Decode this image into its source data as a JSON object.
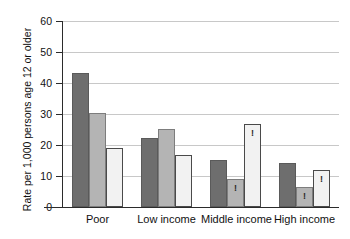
{
  "chart_data": {
    "type": "bar",
    "title": "",
    "subtitle": "",
    "xlabel": "",
    "ylabel": "Rate per 1,000 persons age 12 or older",
    "categories": [
      "Poor",
      "Low income",
      "Middle income",
      "High income"
    ],
    "ylim": [
      0,
      60
    ],
    "yticks": [
      0,
      10,
      20,
      30,
      40,
      50,
      60
    ],
    "ytick_labels": [
      "0",
      "10",
      "20",
      "30",
      "40",
      "50",
      "60"
    ],
    "grid": true,
    "legend": false,
    "legend_position": "none",
    "series": [
      {
        "name": "series-1",
        "color": "#6e6e6e",
        "shade": "dark",
        "values": [
          43.3,
          22.2,
          15.2,
          14.2
        ],
        "flags": [
          "",
          "",
          "",
          ""
        ]
      },
      {
        "name": "series-2",
        "color": "#b4b4b4",
        "shade": "medium",
        "values": [
          30.2,
          25.3,
          9.1,
          6.5
        ],
        "flags": [
          "",
          "",
          "!",
          "!"
        ]
      },
      {
        "name": "series-3",
        "color": "#f2f2f2",
        "shade": "light",
        "values": [
          18.9,
          16.9,
          26.8,
          11.8
        ],
        "flags": [
          "",
          "",
          "!",
          "!"
        ]
      }
    ],
    "annotations": [
      {
        "text": "!",
        "meaning": "interpret-with-caution-estimate",
        "category": "Middle income",
        "series": "series-2"
      },
      {
        "text": "!",
        "meaning": "interpret-with-caution-estimate",
        "category": "Middle income",
        "series": "series-3"
      },
      {
        "text": "!",
        "meaning": "interpret-with-caution-estimate",
        "category": "High income",
        "series": "series-2"
      },
      {
        "text": "!",
        "meaning": "interpret-with-caution-estimate",
        "category": "High income",
        "series": "series-3"
      }
    ]
  },
  "axis": {
    "y_title": "Rate per 1,000 persons age 12 or older",
    "tick_0": "0",
    "tick_10": "10",
    "tick_20": "20",
    "tick_30": "30",
    "tick_40": "40",
    "tick_50": "50",
    "tick_60": "60"
  },
  "categories": {
    "c0": "Poor",
    "c1": "Low income",
    "c2": "Middle income",
    "c3": "High income"
  },
  "colors": {
    "series_dark": "#6e6e6e",
    "series_medium": "#b4b4b4",
    "series_light": "#f2f2f2",
    "axis": "#2b2b2b",
    "gridline": "#c8c8c8",
    "background": "#ffffff"
  }
}
